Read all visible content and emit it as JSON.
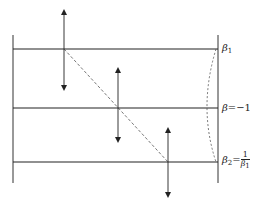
{
  "diagram": {
    "type": "optics-planes-diagram",
    "lines": {
      "left_vertical": {
        "x": 13,
        "y1": 35,
        "y2": 183
      },
      "right_vertical": {
        "x": 218,
        "y1": 35,
        "y2": 183
      },
      "horizontal": [
        {
          "id": "beta1-plane",
          "y": 49
        },
        {
          "id": "beta-minus1-plane",
          "y": 108
        },
        {
          "id": "beta2-plane",
          "y": 162
        }
      ]
    },
    "arrows": [
      {
        "id": "arrow-1",
        "x": 64,
        "y_top": 10,
        "y_bottom": 90
      },
      {
        "id": "arrow-2",
        "x": 118,
        "y_top": 68,
        "y_bottom": 142
      },
      {
        "id": "arrow-3",
        "x": 168,
        "y_top": 128,
        "y_bottom": 197
      }
    ],
    "dashed_diagonal": {
      "x1": 64,
      "y1": 49,
      "x2": 168,
      "y2": 162
    },
    "dashed_arc": {
      "x_start": 216,
      "y_start": 49,
      "x_ctrl": 198,
      "y_ctrl": 108,
      "x_end": 216,
      "y_end": 162
    },
    "labels": {
      "beta1": {
        "symbol": "β",
        "subscript": "1"
      },
      "beta_mid": {
        "symbol": "β",
        "equals": "=−1"
      },
      "beta2": {
        "symbol": "β",
        "subscript": "2",
        "equals": "=",
        "frac_num": "1",
        "frac_den_symbol": "β",
        "frac_den_sub": "1"
      }
    },
    "colors": {
      "line": "#222222",
      "dashed": "#555555",
      "background": "#ffffff"
    }
  }
}
